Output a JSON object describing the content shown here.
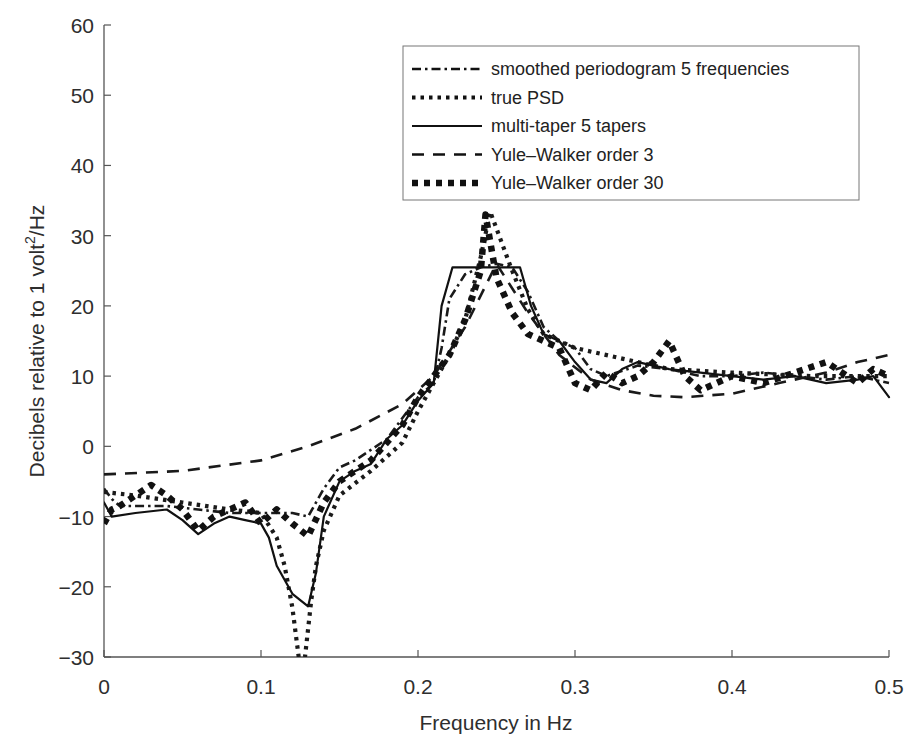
{
  "chart_data": {
    "type": "line",
    "title": "",
    "xlabel": "Frequency in Hz",
    "ylabel": "Decibels relative to 1 volt^2/Hz",
    "ylabel_parts": {
      "prefix": "Decibels relative to 1 volt",
      "sup": "2",
      "suffix": "/Hz"
    },
    "xlim": [
      0,
      0.5
    ],
    "ylim": [
      -30,
      60
    ],
    "xticks": [
      0,
      0.1,
      0.2,
      0.3,
      0.4,
      0.5
    ],
    "xtick_labels": [
      "0",
      "0.1",
      "0.2",
      "0.3",
      "0.4",
      "0.5"
    ],
    "yticks": [
      -30,
      -20,
      -10,
      0,
      10,
      20,
      30,
      40,
      50,
      60
    ],
    "ytick_labels": [
      "−30",
      "−20",
      "−10",
      "0",
      "10",
      "20",
      "30",
      "40",
      "50",
      "60"
    ],
    "grid": false,
    "legend_position": "upper right",
    "series": [
      {
        "name": "smoothed periodogram 5 frequencies",
        "style": "dash-dot",
        "color": "#1a1a1a",
        "x": [
          0,
          0.005,
          0.01,
          0.02,
          0.04,
          0.06,
          0.08,
          0.1,
          0.12,
          0.13,
          0.14,
          0.15,
          0.16,
          0.18,
          0.2,
          0.21,
          0.215,
          0.22,
          0.23,
          0.24,
          0.25,
          0.26,
          0.27,
          0.28,
          0.29,
          0.3,
          0.31,
          0.32,
          0.34,
          0.36,
          0.38,
          0.4,
          0.42,
          0.44,
          0.46,
          0.48,
          0.5
        ],
        "y": [
          -6,
          -7.5,
          -8.5,
          -8.5,
          -8.5,
          -9,
          -9.5,
          -9.5,
          -9.5,
          -10,
          -6,
          -3,
          -2,
          1,
          7,
          9,
          14,
          21,
          24.5,
          25.5,
          26,
          25.5,
          22,
          17,
          15,
          14,
          11,
          10,
          11.5,
          11,
          10,
          10,
          10.5,
          10,
          9.5,
          10,
          9
        ]
      },
      {
        "name": "true PSD",
        "style": "dotted",
        "color": "#1a1a1a",
        "x": [
          0,
          0.02,
          0.05,
          0.08,
          0.1,
          0.11,
          0.115,
          0.12,
          0.124,
          0.128,
          0.132,
          0.135,
          0.14,
          0.15,
          0.17,
          0.19,
          0.2,
          0.21,
          0.22,
          0.23,
          0.24,
          0.246,
          0.25,
          0.26,
          0.27,
          0.28,
          0.3,
          0.33,
          0.36,
          0.4,
          0.45,
          0.5
        ],
        "y": [
          -6.5,
          -7,
          -8,
          -9,
          -9.5,
          -13,
          -17,
          -23,
          -30,
          -30,
          -22,
          -17,
          -12,
          -7,
          -3.5,
          0.5,
          5,
          9,
          13,
          18,
          27,
          33.4,
          31,
          25,
          19.5,
          16,
          14,
          12.5,
          11,
          10.5,
          10,
          10
        ]
      },
      {
        "name": "multi-taper 5 tapers",
        "style": "solid",
        "color": "#111111",
        "x": [
          0,
          0.005,
          0.02,
          0.04,
          0.05,
          0.06,
          0.07,
          0.08,
          0.09,
          0.1,
          0.105,
          0.11,
          0.12,
          0.13,
          0.135,
          0.14,
          0.15,
          0.16,
          0.17,
          0.18,
          0.19,
          0.2,
          0.21,
          0.215,
          0.222,
          0.265,
          0.272,
          0.28,
          0.29,
          0.3,
          0.31,
          0.32,
          0.33,
          0.34,
          0.36,
          0.38,
          0.4,
          0.42,
          0.44,
          0.46,
          0.48,
          0.49,
          0.5
        ],
        "y": [
          -8,
          -10,
          -9.5,
          -9,
          -10.5,
          -12.5,
          -11,
          -10,
          -10.5,
          -11,
          -13,
          -17,
          -21,
          -22.8,
          -18,
          -10,
          -5,
          -3.5,
          -2.5,
          1,
          3,
          6.5,
          9,
          20,
          25.5,
          25.5,
          20,
          16,
          15,
          12,
          9.5,
          9,
          11,
          12,
          11,
          10.5,
          10,
          9.5,
          10,
          9,
          9.5,
          10,
          7
        ]
      },
      {
        "name": "Yule–Walker order 3",
        "style": "dashed",
        "color": "#1a1a1a",
        "x": [
          0,
          0.05,
          0.1,
          0.13,
          0.16,
          0.19,
          0.21,
          0.23,
          0.25,
          0.27,
          0.29,
          0.31,
          0.33,
          0.35,
          0.37,
          0.4,
          0.43,
          0.46,
          0.48,
          0.5
        ],
        "y": [
          -4,
          -3.5,
          -2,
          0,
          2.5,
          6,
          10,
          17,
          26,
          19,
          13,
          9.5,
          8,
          7.2,
          7,
          7.5,
          9,
          10.5,
          12,
          13
        ]
      },
      {
        "name": "Yule–Walker order 30",
        "style": "heavy-dashed",
        "color": "#111111",
        "x": [
          0,
          0.005,
          0.01,
          0.02,
          0.03,
          0.04,
          0.05,
          0.06,
          0.07,
          0.08,
          0.09,
          0.1,
          0.11,
          0.12,
          0.13,
          0.14,
          0.15,
          0.17,
          0.19,
          0.2,
          0.21,
          0.22,
          0.23,
          0.24,
          0.243,
          0.25,
          0.26,
          0.27,
          0.28,
          0.29,
          0.3,
          0.31,
          0.32,
          0.33,
          0.34,
          0.35,
          0.36,
          0.37,
          0.38,
          0.4,
          0.42,
          0.44,
          0.46,
          0.48,
          0.49,
          0.5
        ],
        "y": [
          -11,
          -9,
          -8.5,
          -7,
          -5.5,
          -7,
          -9,
          -12,
          -10,
          -9,
          -8,
          -11,
          -9,
          -11,
          -12.8,
          -8,
          -5,
          -2,
          3,
          7,
          10,
          13,
          18,
          25,
          33,
          24,
          19,
          16,
          15,
          14,
          9,
          8,
          10.5,
          9,
          10,
          12,
          15,
          10,
          8,
          10,
          9,
          10.5,
          12,
          9,
          11,
          10
        ]
      }
    ]
  },
  "legend": {
    "items": [
      {
        "label": "smoothed periodogram 5 frequencies",
        "style": "dash-dot"
      },
      {
        "label": "true PSD",
        "style": "dotted"
      },
      {
        "label": "multi-taper 5 tapers",
        "style": "solid"
      },
      {
        "label": "Yule–Walker order 3",
        "style": "dashed"
      },
      {
        "label": "Yule–Walker order 30",
        "style": "heavy-dashed"
      }
    ]
  }
}
